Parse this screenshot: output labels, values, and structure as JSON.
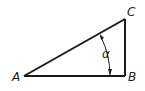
{
  "diagram": {
    "type": "right-triangle",
    "vertices": {
      "A": {
        "label": "A",
        "x": 24,
        "y": 76
      },
      "B": {
        "label": "B",
        "x": 125,
        "y": 76
      },
      "C": {
        "label": "C",
        "x": 125,
        "y": 19
      }
    },
    "angle": {
      "label": "α",
      "vertex": "A"
    },
    "colors": {
      "stroke": "#1a1a1a",
      "text": "#222222"
    }
  }
}
